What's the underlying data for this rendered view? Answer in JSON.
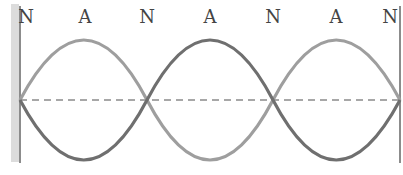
{
  "diagram": {
    "title": "",
    "type": "standing-wave",
    "labels": [
      "N",
      "A",
      "N",
      "A",
      "N",
      "A",
      "N"
    ],
    "label_x": [
      26,
      85,
      147,
      210,
      273,
      336,
      394
    ],
    "nodes_x": [
      20,
      147,
      273,
      400
    ],
    "antinodes_x": [
      84,
      210,
      336
    ],
    "centerline_y": 100,
    "amplitude": 60,
    "colors": {
      "wave_light": "#9a9a9a",
      "wave_dark": "#6e6e6e",
      "centerline": "#8a8a8a",
      "wall": "#666666",
      "wall_shade": "#d8d8d8",
      "label": "#444444"
    }
  }
}
